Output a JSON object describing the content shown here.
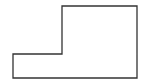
{
  "diagram": {
    "shape": "L-shaped polygon outline",
    "stroke_color": "#333333",
    "fill_color": "#ffffff"
  }
}
